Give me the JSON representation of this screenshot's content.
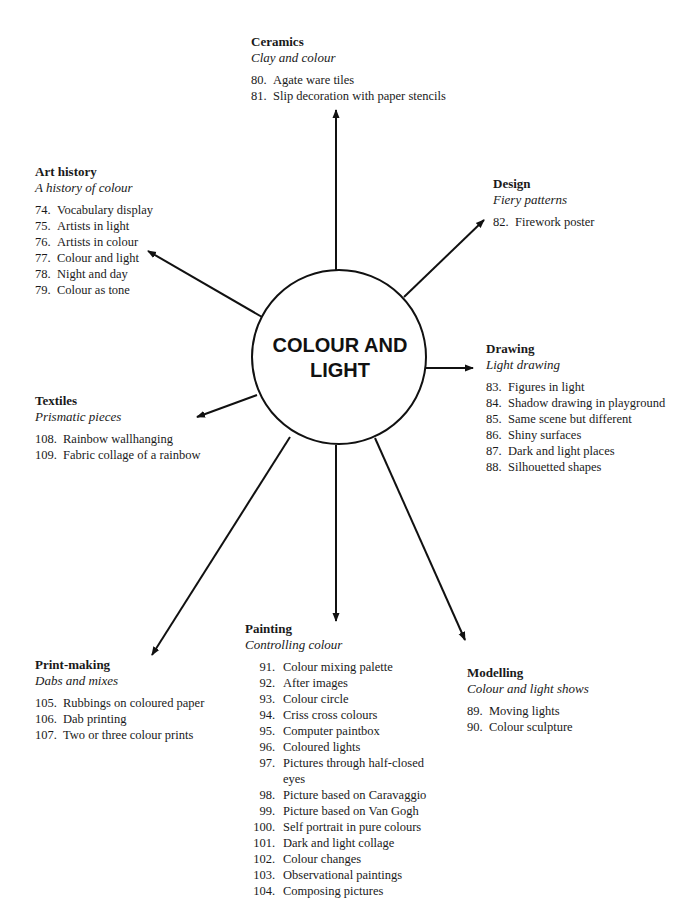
{
  "center": {
    "label": "COLOUR AND LIGHT"
  },
  "topics": {
    "ceramics": {
      "title": "Ceramics",
      "subtitle": "Clay and colour",
      "items": [
        {
          "num": "80.",
          "text": "Agate ware tiles"
        },
        {
          "num": "81.",
          "text": "Slip decoration with paper stencils"
        }
      ]
    },
    "art_history": {
      "title": "Art history",
      "subtitle": "A history of colour",
      "items": [
        {
          "num": "74.",
          "text": "Vocabulary display"
        },
        {
          "num": "75.",
          "text": "Artists in light"
        },
        {
          "num": "76.",
          "text": "Artists in colour"
        },
        {
          "num": "77.",
          "text": "Colour and light"
        },
        {
          "num": "78.",
          "text": "Night and day"
        },
        {
          "num": "79.",
          "text": "Colour as tone"
        }
      ]
    },
    "design": {
      "title": "Design",
      "subtitle": "Fiery patterns",
      "items": [
        {
          "num": "82.",
          "text": "Firework poster"
        }
      ]
    },
    "drawing": {
      "title": "Drawing",
      "subtitle": "Light drawing",
      "items": [
        {
          "num": "83.",
          "text": "Figures in light"
        },
        {
          "num": "84.",
          "text": "Shadow drawing in playground"
        },
        {
          "num": "85.",
          "text": "Same scene but different"
        },
        {
          "num": "86.",
          "text": "Shiny surfaces"
        },
        {
          "num": "87.",
          "text": "Dark and light places"
        },
        {
          "num": "88.",
          "text": "Silhouetted shapes"
        }
      ]
    },
    "textiles": {
      "title": "Textiles",
      "subtitle": "Prismatic pieces",
      "items": [
        {
          "num": "108.",
          "text": "Rainbow wallhanging"
        },
        {
          "num": "109.",
          "text": "Fabric collage of a rainbow"
        }
      ]
    },
    "print_making": {
      "title": "Print-making",
      "subtitle": "Dabs and mixes",
      "items": [
        {
          "num": "105.",
          "text": "Rubbings on coloured paper"
        },
        {
          "num": "106.",
          "text": "Dab printing"
        },
        {
          "num": "107.",
          "text": "Two or three colour prints"
        }
      ]
    },
    "painting": {
      "title": "Painting",
      "subtitle": "Controlling colour",
      "items": [
        {
          "num": "91.",
          "text": "Colour mixing palette"
        },
        {
          "num": "92.",
          "text": "After images"
        },
        {
          "num": "93.",
          "text": "Colour circle"
        },
        {
          "num": "94.",
          "text": "Criss cross colours"
        },
        {
          "num": "95.",
          "text": "Computer paintbox"
        },
        {
          "num": "96.",
          "text": "Coloured lights"
        },
        {
          "num": "97.",
          "text": "Pictures through half-closed eyes"
        },
        {
          "num": "98.",
          "text": "Picture based on Caravaggio"
        },
        {
          "num": "99.",
          "text": "Picture based on Van Gogh"
        },
        {
          "num": "100.",
          "text": "Self portrait in pure colours"
        },
        {
          "num": "101.",
          "text": "Dark and light collage"
        },
        {
          "num": "102.",
          "text": "Colour changes"
        },
        {
          "num": "103.",
          "text": "Observational paintings"
        },
        {
          "num": "104.",
          "text": "Composing pictures"
        }
      ]
    },
    "modelling": {
      "title": "Modelling",
      "subtitle": "Colour and light shows",
      "items": [
        {
          "num": "89.",
          "text": "Moving lights"
        },
        {
          "num": "90.",
          "text": "Colour sculpture"
        }
      ]
    }
  }
}
